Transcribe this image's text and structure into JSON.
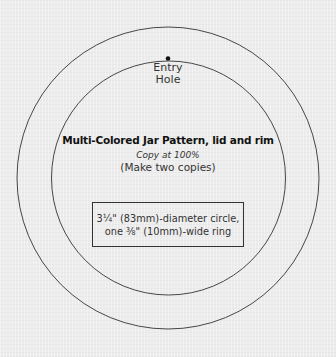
{
  "diagram": {
    "entry_label_line1": "Entry",
    "entry_label_line2": "Hole",
    "title": "Multi-Colored Jar Pattern, lid and rim",
    "subtitle": "Copy at 100%",
    "note": "(Make two copies)",
    "spec_line1": "3¼\" (83mm)-diameter circle,",
    "spec_line2": "one ⅜\" (10mm)-wide ring",
    "colors": {
      "background": "#ececec",
      "stroke": "#333333",
      "text": "#1a1a1a"
    }
  }
}
